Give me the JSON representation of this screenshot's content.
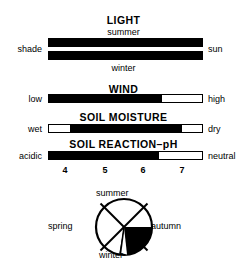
{
  "figure": {
    "type": "ecological-indicator-bars",
    "bars": [
      {
        "id": "light",
        "title": "LIGHT",
        "subtitle_top": "summer",
        "subtitle_bottom": "winter",
        "left_label": "shade",
        "right_label": "sun",
        "rows": [
          {
            "name": "summer",
            "fill_start_pct": 0,
            "fill_end_pct": 100
          },
          {
            "name": "winter",
            "fill_start_pct": 0,
            "fill_end_pct": 100
          }
        ]
      },
      {
        "id": "wind",
        "title": "WIND",
        "left_label": "low",
        "right_label": "high",
        "rows": [
          {
            "name": "wind",
            "fill_start_pct": 0,
            "fill_end_pct": 74
          }
        ]
      },
      {
        "id": "soil-moisture",
        "title": "SOIL MOISTURE",
        "left_label": "wet",
        "right_label": "dry",
        "rows": [
          {
            "name": "soil-moisture",
            "fill_start_pct": 14,
            "fill_end_pct": 87
          }
        ]
      },
      {
        "id": "soil-reaction-ph",
        "title": "SOIL REACTION–pH",
        "left_label": "acidic",
        "right_label": "neutral",
        "rows": [
          {
            "name": "soil-reaction-ph",
            "fill_start_pct": 0,
            "fill_end_pct": 72
          }
        ],
        "scale": {
          "ticks": [
            {
              "label": "4",
              "pos_pct": 11
            },
            {
              "label": "5",
              "pos_pct": 37
            },
            {
              "label": "6",
              "pos_pct": 61
            },
            {
              "label": "7",
              "pos_pct": 86
            }
          ]
        }
      }
    ],
    "season_wheel": {
      "labels": {
        "top": "summer",
        "bottom": "winter",
        "left": "spring",
        "right": "autumn"
      },
      "shaded_sector": {
        "name": "autumn-to-winter",
        "start_deg": 0,
        "end_deg": 100
      }
    },
    "colors": {
      "ink": "#000000",
      "paper": "#ffffff"
    }
  }
}
